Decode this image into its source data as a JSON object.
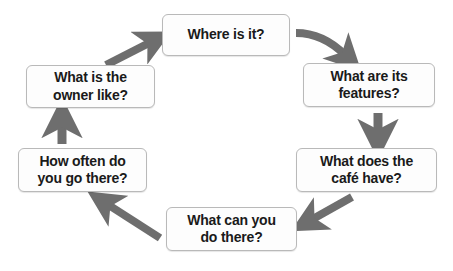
{
  "diagram": {
    "type": "cycle-diagram",
    "background_color": "#ffffff",
    "node_fill_color": "#fdfdfd",
    "node_border_color": "#b9b9b9",
    "node_text_color": "#1a1a1a",
    "arrow_color": "#6e6e6e",
    "direction": "clockwise",
    "nodes": [
      {
        "id": "where",
        "position": "top",
        "lines": [
          "Where is it?"
        ],
        "text": "Where is it?"
      },
      {
        "id": "features",
        "position": "top-right",
        "lines": [
          "What are its",
          "features?"
        ],
        "text": "What are its features?"
      },
      {
        "id": "cafe",
        "position": "bottom-right",
        "lines": [
          "What does the",
          "café have?"
        ],
        "text": "What does the café have?"
      },
      {
        "id": "do",
        "position": "bottom",
        "lines": [
          "What can you",
          "do there?"
        ],
        "text": "What can you do there?"
      },
      {
        "id": "often",
        "position": "bottom-left",
        "lines": [
          "How often do",
          "you go there?"
        ],
        "text": "How often do you go there?"
      },
      {
        "id": "owner",
        "position": "top-left",
        "lines": [
          "What is the",
          "owner like?"
        ],
        "text": "What is the owner like?"
      }
    ],
    "arrows": [
      {
        "id": "arrow-where-to-features",
        "from": "where",
        "to": "features",
        "shape": "curved",
        "label": ""
      },
      {
        "id": "arrow-features-to-cafe",
        "from": "features",
        "to": "cafe",
        "shape": "straight-down",
        "label": ""
      },
      {
        "id": "arrow-cafe-to-do",
        "from": "cafe",
        "to": "do",
        "shape": "diagonal-down-left",
        "label": ""
      },
      {
        "id": "arrow-do-to-often",
        "from": "do",
        "to": "often",
        "shape": "diagonal-up-left",
        "label": ""
      },
      {
        "id": "arrow-often-to-owner",
        "from": "often",
        "to": "owner",
        "shape": "straight-up",
        "label": ""
      },
      {
        "id": "arrow-owner-to-where",
        "from": "owner",
        "to": "where",
        "shape": "diagonal-up-right",
        "label": ""
      }
    ]
  }
}
